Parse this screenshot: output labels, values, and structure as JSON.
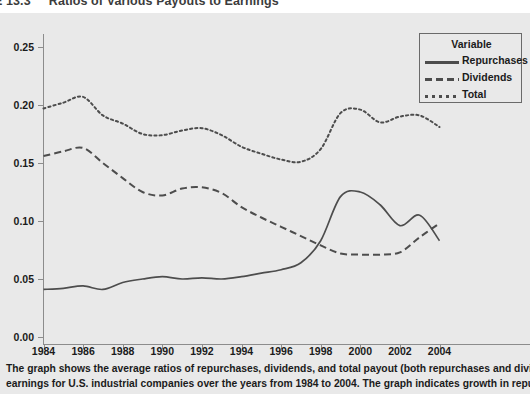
{
  "header": {
    "number": "E 13.3",
    "title": "Ratios of Various Payouts to Earnings"
  },
  "legend": {
    "title": "Variable",
    "items": [
      {
        "label": "Repurchases",
        "style": "solid"
      },
      {
        "label": "Dividends",
        "style": "dashed"
      },
      {
        "label": "Total",
        "style": "dotted"
      }
    ]
  },
  "caption": {
    "line1": "The graph shows the average ratios of repurchases, dividends, and total payout (both repurchases and dividends) to",
    "line2": "earnings for U.S. industrial companies over the years from 1984 to 2004. The graph indicates growth in repurchases over"
  },
  "colors": {
    "background": "#e9e9e9",
    "line": "#4d4d4d",
    "axis": "#8c8c8c",
    "text": "#1b1b1b"
  },
  "chart_data": {
    "type": "line",
    "title": "Ratios of Various Payouts to Earnings",
    "xlabel": "",
    "ylabel": "",
    "xlim": [
      1983.5,
      2005.5
    ],
    "ylim": [
      0.0,
      0.268
    ],
    "grid": false,
    "legend_position": "top-right",
    "x": [
      1984,
      1985,
      1986,
      1987,
      1988,
      1989,
      1990,
      1991,
      1992,
      1993,
      1994,
      1995,
      1996,
      1997,
      1998,
      1999,
      2000,
      2001,
      2002,
      2003,
      2004
    ],
    "xticks": [
      1984,
      1986,
      1988,
      1990,
      1992,
      1994,
      1996,
      1998,
      2000,
      2002,
      2004
    ],
    "yticks": [
      0.0,
      0.05,
      0.1,
      0.15,
      0.2,
      0.25
    ],
    "ytick_labels": [
      "0.00",
      "0.05",
      "0.10",
      "0.15",
      "0.20",
      "0.25"
    ],
    "series": [
      {
        "name": "Repurchases",
        "style": "solid",
        "values": [
          0.041,
          0.042,
          0.044,
          0.041,
          0.047,
          0.05,
          0.052,
          0.05,
          0.051,
          0.05,
          0.052,
          0.055,
          0.058,
          0.064,
          0.083,
          0.121,
          0.125,
          0.114,
          0.096,
          0.105,
          0.083
        ]
      },
      {
        "name": "Dividends",
        "style": "dashed",
        "values": [
          0.156,
          0.16,
          0.163,
          0.15,
          0.137,
          0.125,
          0.122,
          0.128,
          0.129,
          0.124,
          0.112,
          0.103,
          0.095,
          0.087,
          0.079,
          0.072,
          0.071,
          0.071,
          0.073,
          0.086,
          0.098
        ]
      },
      {
        "name": "Total",
        "style": "dotted",
        "values": [
          0.197,
          0.202,
          0.207,
          0.191,
          0.184,
          0.175,
          0.174,
          0.178,
          0.18,
          0.174,
          0.164,
          0.158,
          0.153,
          0.151,
          0.162,
          0.193,
          0.196,
          0.185,
          0.19,
          0.191,
          0.181
        ]
      }
    ]
  }
}
